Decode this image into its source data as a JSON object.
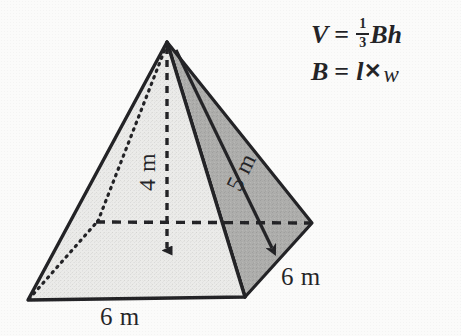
{
  "figure": {
    "background_color": "#fbfbfa",
    "outline_color": "#17171a",
    "face_light_color": "#e8e8e6",
    "face_mid_color": "#a9a9a7",
    "face_dark_color": "#9d9d9b"
  },
  "labels": {
    "height": "4 m",
    "slant": "5 m",
    "base_front": "6 m",
    "base_right": "6 m"
  },
  "formulas": {
    "volume": {
      "lhs": "V",
      "equals": "=",
      "fraction_numerator": "1",
      "fraction_denominator": "3",
      "rhs_base": "B",
      "rhs_height": "h",
      "full_text": "V = 1/3 Bh"
    },
    "base_area": {
      "lhs": "B",
      "equals": "=",
      "length": "l",
      "times": "✕",
      "width": "w",
      "full_text": "B = l ✕ w"
    }
  },
  "geometry": {
    "apex": [
      167,
      42
    ],
    "front_left_vertex": [
      28,
      300
    ],
    "front_right_vertex": [
      245,
      297
    ],
    "right_vertex": [
      312,
      223
    ],
    "back_vertex": [
      97,
      222
    ],
    "height_foot": [
      167,
      258
    ],
    "slant_arrow_end": [
      281,
      256
    ]
  }
}
